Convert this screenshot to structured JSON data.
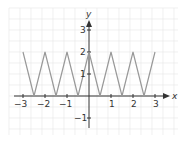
{
  "chart_data": {
    "type": "line",
    "title": "",
    "xlabel": "x",
    "ylabel": "y",
    "xlim": [
      -3.5,
      4
    ],
    "ylim": [
      -2,
      4
    ],
    "grid": true,
    "x_ticks": [
      "-3",
      "-2",
      "-1",
      "1",
      "2",
      "3"
    ],
    "y_ticks": [
      "-1",
      "1",
      "2",
      "3"
    ],
    "series": [
      {
        "name": "triangle wave",
        "color": "#999999",
        "x": [
          -3,
          -2.5,
          -2,
          -1.5,
          -1,
          -0.5,
          0,
          0.5,
          1,
          1.5,
          2,
          2.5,
          3
        ],
        "y": [
          2,
          0,
          2,
          0,
          2,
          0,
          2,
          0,
          2,
          0,
          2,
          0,
          2
        ]
      }
    ]
  },
  "labels": {
    "x_axis": "x",
    "y_axis": "y",
    "xt": [
      "−3",
      "−2",
      "−1",
      "1",
      "2",
      "3"
    ],
    "yt": [
      "3",
      "2",
      "1",
      "−1"
    ]
  }
}
